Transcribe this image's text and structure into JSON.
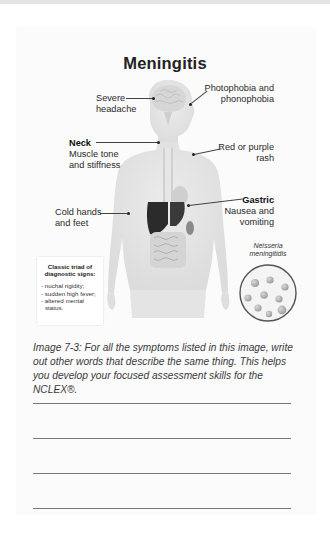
{
  "page": {
    "title": "Meningitis",
    "figure": {
      "labels": {
        "severe_headache": [
          "Severe",
          "headache"
        ],
        "photophobia": [
          "Photophobia and",
          "phonophobia"
        ],
        "neck_heading": "Neck",
        "neck_text": [
          "Muscle tone",
          "and stiffness"
        ],
        "rash": [
          "Red or purple",
          "rash"
        ],
        "gastric_heading": "Gastric",
        "gastric_text": [
          "Nausea and",
          "vomiting"
        ],
        "cold_hands": [
          "Cold hands",
          "and feet"
        ]
      },
      "triad_box": {
        "heading": [
          "Classic triad of",
          "diagnostic signs:"
        ],
        "items": [
          "- nuchal rigidity;",
          "- sudden high fever;",
          "- altered mental",
          "  status."
        ]
      },
      "bacteria_label": [
        "Neisseria",
        "meningitidis"
      ]
    },
    "caption": "Image 7-3: For all the symptoms listed in this image, write out other words that describe the same thing. This helps you develop your focused assessment skills for the NCLEX®.",
    "writing_lines_count": 4
  }
}
